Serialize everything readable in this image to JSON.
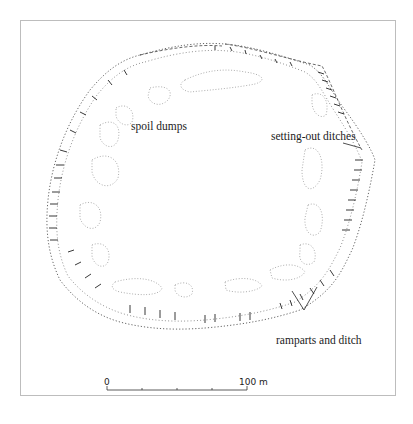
{
  "figure": {
    "type": "archaeological site plan",
    "labels": {
      "spoil_dumps": "spoil dumps",
      "setting_out_ditches": "setting-out ditches",
      "ramparts_and_ditch": "ramparts and ditch"
    },
    "scale_bar": {
      "start_label": "0",
      "end_label": "100 m",
      "ticks": 4
    },
    "colors": {
      "ink": "#222222",
      "dotted": "#8a8a8a",
      "frame": "#bdbdbd",
      "background": "#ffffff"
    }
  }
}
